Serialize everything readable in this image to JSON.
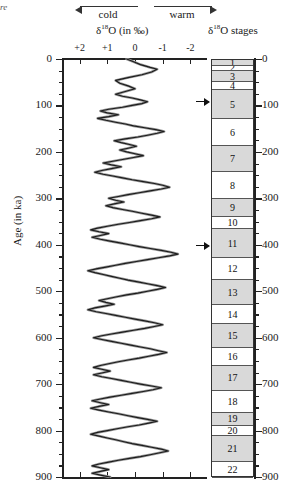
{
  "corner_fragment": "re",
  "header": {
    "cold_label": "cold",
    "warm_label": "warm",
    "delta_title_pre": "δ",
    "delta_title_sup": "18",
    "delta_title_post": "O (in ‰)",
    "stages_title_pre": "δ",
    "stages_title_sup": "18",
    "stages_title_post": "O stages"
  },
  "chart_data": {
    "type": "line",
    "title": "δ18O (in ‰)",
    "xlabel": "δ18O (in ‰)",
    "ylabel": "Age (in ka)",
    "grid": false,
    "legend": "none",
    "x_direction": "reversed",
    "xlim": [
      2.6,
      -2.6
    ],
    "ylim": [
      900,
      0
    ],
    "xticks": [
      "+2",
      "+1",
      "0",
      "-1",
      "-2"
    ],
    "xtick_values": [
      2,
      1,
      0,
      -1,
      -2
    ],
    "yticks": [
      0,
      100,
      200,
      300,
      400,
      500,
      600,
      700,
      800,
      900
    ],
    "ytick_minor_step": 25,
    "axis_annotations": {
      "left_arrow": "cold",
      "right_arrow": "warm"
    },
    "series": [
      {
        "name": "δ18O benthic record",
        "x": [
          0.3,
          0.05,
          -0.2,
          -0.55,
          -0.8,
          -0.6,
          -0.25,
          0.25,
          0.7,
          0.55,
          0.25,
          0.0,
          0.35,
          0.7,
          0.45,
          0.1,
          -0.2,
          -0.45,
          -0.25,
          0.1,
          0.45,
          0.95,
          1.25,
          1.0,
          0.6,
          0.95,
          1.35,
          1.05,
          0.7,
          0.35,
          0.05,
          -0.35,
          -0.75,
          -1.05,
          -0.8,
          -0.45,
          -0.1,
          0.35,
          0.75,
          0.5,
          0.2,
          -0.05,
          0.25,
          0.55,
          0.3,
          0.0,
          -0.3,
          0.05,
          0.4,
          0.8,
          1.15,
          0.85,
          0.5,
          0.85,
          1.2,
          1.45,
          1.15,
          0.8,
          0.45,
          0.1,
          -0.3,
          -0.7,
          -1.0,
          -1.25,
          -0.95,
          -0.55,
          -0.15,
          0.25,
          0.6,
          0.95,
          0.7,
          0.4,
          0.75,
          1.05,
          0.8,
          0.45,
          0.1,
          -0.25,
          -0.6,
          -0.9,
          -0.6,
          -0.2,
          0.2,
          0.6,
          1.0,
          1.35,
          1.6,
          1.3,
          0.95,
          1.25,
          1.55,
          1.25,
          0.9,
          0.55,
          0.2,
          -0.15,
          -0.55,
          -0.95,
          -1.3,
          -1.55,
          -1.25,
          -0.85,
          -0.45,
          -0.05,
          0.35,
          0.7,
          1.05,
          1.4,
          1.7,
          1.45,
          1.15,
          0.85,
          0.55,
          0.25,
          -0.1,
          -0.45,
          -0.8,
          -1.1,
          -0.8,
          -0.45,
          -0.1,
          0.3,
          0.65,
          1.0,
          1.3,
          1.05,
          0.75,
          1.1,
          1.45,
          1.7,
          1.4,
          1.05,
          0.7,
          0.35,
          0.0,
          -0.35,
          -0.7,
          -1.0,
          -0.7,
          -0.35,
          0.05,
          0.45,
          0.85,
          1.2,
          1.5,
          1.2,
          0.85,
          0.5,
          0.15,
          -0.2,
          -0.55,
          -0.85,
          -1.15,
          -0.85,
          -0.5,
          -0.15,
          0.25,
          0.6,
          0.95,
          1.25,
          1.5,
          1.2,
          0.9,
          1.2,
          1.5,
          1.2,
          0.85,
          0.5,
          0.15,
          -0.2,
          -0.6,
          -0.95,
          -0.65,
          -0.3,
          0.1,
          0.5,
          0.9,
          1.25,
          1.55,
          1.25,
          0.95,
          1.3,
          1.6,
          1.3,
          0.95,
          0.6,
          0.25,
          -0.1,
          -0.45,
          -0.8,
          -0.5,
          -0.15,
          0.25,
          0.65,
          1.0,
          1.35,
          1.6,
          1.3,
          1.0,
          0.7,
          0.4,
          0.1,
          -0.25,
          -0.6,
          -0.95,
          -1.2,
          -0.9,
          -0.55,
          -0.2,
          0.2,
          0.6,
          0.95,
          1.3,
          1.55,
          1.25,
          0.95,
          1.25,
          1.55,
          1.25,
          0.9,
          0.55,
          0.2,
          -0.15,
          -0.5,
          -0.85,
          -1.15,
          -1.4,
          -1.1,
          -0.75,
          -0.4,
          -0.05,
          0.3,
          0.65,
          1.0,
          1.3,
          1.55,
          1.25,
          0.95,
          1.25,
          1.5,
          1.2,
          0.9,
          0.55,
          0.2,
          -0.15,
          -0.5,
          -0.85,
          -1.1,
          -0.8,
          -0.45,
          -0.1,
          0.3,
          0.7,
          1.05,
          1.35,
          1.6,
          1.35,
          1.05,
          1.35,
          1.6,
          1.3,
          1.0,
          0.65,
          0.3,
          -0.05,
          -0.4,
          -0.75,
          -1.05,
          -1.3,
          -1.55,
          -1.75,
          -1.5,
          -1.2,
          -0.9,
          -0.6,
          -0.3,
          0.05,
          0.4,
          0.75,
          1.05,
          1.3,
          1.05,
          0.8
        ],
        "y": [
          0,
          6,
          12,
          18,
          22,
          28,
          34,
          40,
          46,
          52,
          58,
          64,
          70,
          76,
          80,
          84,
          88,
          92,
          96,
          100,
          104,
          108,
          112,
          116,
          120,
          124,
          128,
          132,
          136,
          140,
          144,
          148,
          152,
          156,
          160,
          164,
          168,
          172,
          176,
          180,
          184,
          188,
          192,
          196,
          200,
          204,
          208,
          212,
          216,
          220,
          224,
          228,
          232,
          236,
          240,
          244,
          248,
          252,
          256,
          260,
          264,
          268,
          272,
          276,
          280,
          284,
          288,
          292,
          296,
          300,
          304,
          308,
          312,
          316,
          320,
          324,
          328,
          332,
          336,
          340,
          344,
          348,
          352,
          356,
          360,
          364,
          368,
          372,
          376,
          380,
          384,
          388,
          392,
          396,
          400,
          404,
          408,
          412,
          416,
          420,
          424,
          428,
          432,
          436,
          440,
          444,
          448,
          452,
          456,
          460,
          464,
          468,
          472,
          476,
          480,
          484,
          488,
          492,
          496,
          500,
          504,
          508,
          512,
          516,
          520,
          524,
          528,
          532,
          536,
          540,
          544,
          548,
          552,
          556,
          560,
          564,
          568,
          572,
          576,
          580,
          584,
          588,
          592,
          596,
          600,
          604,
          608,
          612,
          616,
          620,
          624,
          628,
          632,
          636,
          640,
          644,
          648,
          652,
          656,
          660,
          664,
          668,
          672,
          676,
          680,
          684,
          688,
          692,
          696,
          700,
          704,
          708,
          712,
          716,
          720,
          724,
          728,
          732,
          736,
          740,
          744,
          748,
          752,
          756,
          760,
          764,
          768,
          772,
          776,
          780,
          784,
          788,
          792,
          796,
          800,
          804,
          808,
          812,
          816,
          820,
          824,
          828,
          832,
          836,
          840,
          844,
          848,
          852,
          856,
          860,
          864,
          868,
          872,
          876,
          880,
          884,
          888,
          892,
          896,
          900,
          904,
          908,
          912,
          916,
          920,
          924,
          928,
          932,
          936,
          940,
          944,
          948,
          952,
          956,
          960,
          964,
          968,
          972,
          976,
          980,
          984,
          988,
          992,
          996,
          1000,
          1004,
          1008,
          1012,
          1016,
          1020,
          1024,
          1028,
          1032,
          1036,
          1040,
          1044,
          1048,
          1052,
          1056,
          1060,
          1064,
          1068,
          1072,
          1076,
          1080,
          1084,
          1088,
          1092,
          1096,
          1100,
          1104,
          1108,
          1112,
          1116,
          1120,
          1124,
          1128,
          1132,
          1136,
          1140,
          1144,
          1148,
          1152
        ]
      }
    ],
    "stages": [
      {
        "label": "1",
        "top_ka": 0,
        "bottom_ka": 12,
        "shaded": true
      },
      {
        "label": "2",
        "top_ka": 12,
        "bottom_ka": 24,
        "shaded": false
      },
      {
        "label": "3",
        "top_ka": 24,
        "bottom_ka": 48,
        "shaded": true
      },
      {
        "label": "4",
        "top_ka": 48,
        "bottom_ka": 64,
        "shaded": false
      },
      {
        "label": "5",
        "top_ka": 64,
        "bottom_ka": 128,
        "shaded": true
      },
      {
        "label": "6",
        "top_ka": 128,
        "bottom_ka": 186,
        "shaded": false
      },
      {
        "label": "7",
        "top_ka": 186,
        "bottom_ka": 242,
        "shaded": true
      },
      {
        "label": "8",
        "top_ka": 242,
        "bottom_ka": 300,
        "shaded": false
      },
      {
        "label": "9",
        "top_ka": 300,
        "bottom_ka": 337,
        "shaded": true
      },
      {
        "label": "10",
        "top_ka": 337,
        "bottom_ka": 364,
        "shaded": false
      },
      {
        "label": "11",
        "top_ka": 364,
        "bottom_ka": 427,
        "shaded": true
      },
      {
        "label": "12",
        "top_ka": 427,
        "bottom_ka": 474,
        "shaded": false
      },
      {
        "label": "13",
        "top_ka": 474,
        "bottom_ka": 528,
        "shaded": true
      },
      {
        "label": "14",
        "top_ka": 528,
        "bottom_ka": 568,
        "shaded": false
      },
      {
        "label": "15",
        "top_ka": 568,
        "bottom_ka": 621,
        "shaded": true
      },
      {
        "label": "16",
        "top_ka": 621,
        "bottom_ka": 659,
        "shaded": false
      },
      {
        "label": "17",
        "top_ka": 659,
        "bottom_ka": 712,
        "shaded": true
      },
      {
        "label": "18",
        "top_ka": 712,
        "bottom_ka": 760,
        "shaded": false
      },
      {
        "label": "19",
        "top_ka": 760,
        "bottom_ka": 787,
        "shaded": true
      },
      {
        "label": "20",
        "top_ka": 787,
        "bottom_ka": 810,
        "shaded": false
      },
      {
        "label": "21",
        "top_ka": 810,
        "bottom_ka": 865,
        "shaded": true
      },
      {
        "label": "22",
        "top_ka": 865,
        "bottom_ka": 900,
        "shaded": false
      }
    ],
    "stage_pointers_ka": [
      90,
      400
    ]
  }
}
